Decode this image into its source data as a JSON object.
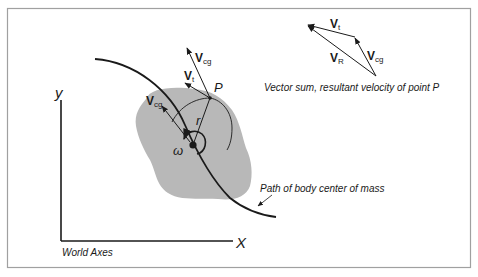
{
  "figure": {
    "frame_color": "#a0a0a0",
    "body_fill": "#b8b8b8",
    "stroke_color": "#1a1a1a"
  },
  "axes": {
    "x_label": "X",
    "y_label": "y",
    "caption": "World Axes"
  },
  "body": {
    "point_label": "P",
    "radius_label": "r",
    "omega_label": "ω",
    "path_caption": "Path of body center of mass"
  },
  "vectors": {
    "v_main": "V",
    "cg_sub": "cg",
    "t_sub": "t",
    "r_sub": "R"
  },
  "vector_sum": {
    "caption": "Vector sum, resultant velocity of point P"
  }
}
